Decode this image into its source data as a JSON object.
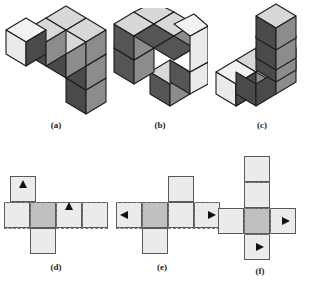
{
  "figure": {
    "background_color": "#ffffff"
  },
  "palette": {
    "face_top_light": "#d8d8d8",
    "face_top_white": "#f2f2f2",
    "face_left_light": "#cfcfcf",
    "face_left_white": "#eaeaea",
    "face_left_dark": "#4a4a4a",
    "face_right_mid": "#8c8c8c",
    "face_right_dark": "#555555",
    "outline": "#1d1d1d",
    "net_fill_light": "#ebebeb",
    "net_fill_shaded": "#c0c0c0",
    "net_outline": "#5a5a5a",
    "fold_line": "#7a7a7a",
    "arrow_color": "#111111"
  },
  "panels": [
    {
      "id": "a",
      "caption": "(a)",
      "kind": "isometric-cube-assembly",
      "cube_count": 6,
      "description": "L-shaped assembly: a row of cubes running back-right with a two-cube arm descending at the front-right",
      "cubes": [
        {
          "col": 0,
          "row": 0,
          "level": 0,
          "top": "white",
          "left": "white",
          "right": "mid"
        },
        {
          "col": 1,
          "row": 0,
          "level": 0,
          "top": "light",
          "left": "dark",
          "right": "mid"
        },
        {
          "col": 2,
          "row": 0,
          "level": 0,
          "top": "light",
          "left": "dark",
          "right": "mid"
        },
        {
          "col": 2,
          "row": 1,
          "level": 0,
          "top": "light",
          "left": "dark",
          "right": "mid"
        },
        {
          "col": 2,
          "row": 2,
          "level": 0,
          "top": "light",
          "left": "dark",
          "right": "mid"
        },
        {
          "col": 2,
          "row": 2,
          "level": -1,
          "top": "none",
          "left": "dark",
          "right": "mid"
        }
      ]
    },
    {
      "id": "b",
      "caption": "(b)",
      "kind": "isometric-cube-assembly",
      "cube_count": 6,
      "description": "Two-tier block: an upper row of three cubes over a lower U-shaped arrangement with a notch in the middle front",
      "cubes": [
        {
          "col": 0,
          "row": 0,
          "level": 1,
          "top": "light",
          "left": "dark",
          "right": "mid"
        },
        {
          "col": 1,
          "row": 0,
          "level": 1,
          "top": "light",
          "left": "dark",
          "right": "mid"
        },
        {
          "col": 2,
          "row": 0,
          "level": 1,
          "top": "light",
          "left": "dark",
          "right": "white"
        },
        {
          "col": 0,
          "row": 0,
          "level": 0,
          "top": "none",
          "left": "dark",
          "right": "mid"
        },
        {
          "col": 2,
          "row": 0,
          "level": 0,
          "top": "light",
          "left": "dark",
          "right": "white"
        },
        {
          "col": 2,
          "row": 1,
          "level": 0,
          "top": "light",
          "left": "dark",
          "right": "mid"
        }
      ]
    },
    {
      "id": "c",
      "caption": "(c)",
      "kind": "isometric-cube-assembly",
      "cube_count": 6,
      "description": "Stepped corner: a base row of three cubes with a stack rising two levels at the back corner",
      "cubes": [
        {
          "col": 0,
          "row": 0,
          "level": 0,
          "top": "white",
          "left": "white",
          "right": "mid"
        },
        {
          "col": 1,
          "row": 0,
          "level": 0,
          "top": "light",
          "left": "dark",
          "right": "mid"
        },
        {
          "col": 2,
          "row": 0,
          "level": 0,
          "top": "light",
          "left": "dark",
          "right": "mid"
        },
        {
          "col": 2,
          "row": 1,
          "level": 0,
          "top": "light",
          "left": "dark",
          "right": "mid"
        },
        {
          "col": 2,
          "row": 1,
          "level": 1,
          "top": "light",
          "left": "dark",
          "right": "mid"
        },
        {
          "col": 2,
          "row": 1,
          "level": 2,
          "top": "light",
          "left": "dark",
          "right": "mid"
        }
      ]
    },
    {
      "id": "d",
      "caption": "(d)",
      "kind": "cube-net",
      "description": "Net with a horizontal strip of four squares, one square above the first square and one square below the second square",
      "grid": {
        "cols": 4,
        "rows": 3,
        "cell_px": 26
      },
      "cells": [
        {
          "col": 0,
          "row": 0,
          "shade": "light"
        },
        {
          "col": 0,
          "row": 1,
          "shade": "light"
        },
        {
          "col": 1,
          "row": 1,
          "shade": "shaded"
        },
        {
          "col": 2,
          "row": 1,
          "shade": "light"
        },
        {
          "col": 3,
          "row": 1,
          "shade": "light"
        },
        {
          "col": 1,
          "row": 2,
          "shade": "light"
        }
      ],
      "arrows": [
        {
          "col": 0,
          "row": 0,
          "direction": "up"
        },
        {
          "col": 2,
          "row": 1,
          "direction": "up"
        }
      ]
    },
    {
      "id": "e",
      "caption": "(e)",
      "kind": "cube-net",
      "description": "Net with a horizontal strip of four squares, one square above the third square and one square below the second square",
      "grid": {
        "cols": 4,
        "rows": 3,
        "cell_px": 26
      },
      "cells": [
        {
          "col": 2,
          "row": 0,
          "shade": "light"
        },
        {
          "col": 0,
          "row": 1,
          "shade": "light"
        },
        {
          "col": 1,
          "row": 1,
          "shade": "shaded"
        },
        {
          "col": 2,
          "row": 1,
          "shade": "light"
        },
        {
          "col": 3,
          "row": 1,
          "shade": "light"
        },
        {
          "col": 1,
          "row": 2,
          "shade": "light"
        }
      ],
      "arrows": [
        {
          "col": 0,
          "row": 1,
          "direction": "left"
        },
        {
          "col": 3,
          "row": 1,
          "direction": "right"
        }
      ]
    },
    {
      "id": "f",
      "caption": "(f)",
      "kind": "cube-net",
      "description": "Cross-shaped net: a vertical strip of four squares crossed by one square left and one square right of the third square",
      "grid": {
        "cols": 3,
        "rows": 4,
        "cell_px": 26
      },
      "cells": [
        {
          "col": 1,
          "row": 0,
          "shade": "light"
        },
        {
          "col": 1,
          "row": 1,
          "shade": "light"
        },
        {
          "col": 0,
          "row": 2,
          "shade": "light"
        },
        {
          "col": 1,
          "row": 2,
          "shade": "shaded"
        },
        {
          "col": 2,
          "row": 2,
          "shade": "light"
        },
        {
          "col": 1,
          "row": 3,
          "shade": "light"
        }
      ],
      "arrows": [
        {
          "col": 2,
          "row": 2,
          "direction": "right"
        },
        {
          "col": 1,
          "row": 3,
          "direction": "right"
        }
      ]
    }
  ]
}
